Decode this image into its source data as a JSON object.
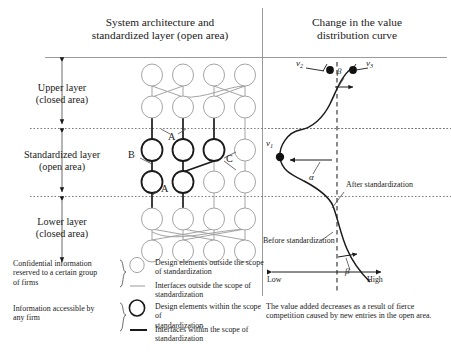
{
  "headers": {
    "left": [
      "System architecture and",
      "standardized layer (open area)"
    ],
    "right": [
      "Change in the value",
      "distribution curve"
    ]
  },
  "axis_labels": [
    {
      "line1": "Upper layer",
      "line2": "(closed area)"
    },
    {
      "line1": "Standardized layer",
      "line2": "(open area)"
    },
    {
      "line1": "Lower layer",
      "line2": "(closed area)"
    }
  ],
  "network_annotations": [
    {
      "name": "A-top",
      "text": "A"
    },
    {
      "name": "B",
      "text": "B"
    },
    {
      "name": "C",
      "text": "C"
    },
    {
      "name": "A-bottom",
      "text": "A"
    }
  ],
  "curve": {
    "point_labels": [
      {
        "name": "nu1",
        "base": "ν",
        "sub": "1"
      },
      {
        "name": "nu2",
        "base": "ν",
        "sub": "2"
      },
      {
        "name": "nu3",
        "base": "ν",
        "sub": "3"
      }
    ],
    "greek": [
      {
        "name": "alpha",
        "text": "α"
      },
      {
        "name": "beta-top",
        "text": "β"
      },
      {
        "name": "beta-bottom",
        "text": "β"
      }
    ],
    "annotations": [
      {
        "name": "after-standardization",
        "text": "After standardization"
      },
      {
        "name": "before-standardization",
        "text": "Before standardization"
      }
    ],
    "scale": {
      "low": "Low",
      "high": "High"
    },
    "caption": [
      "The value added decreases as a result of fierce",
      "competition caused by new entries in the open area."
    ]
  },
  "legend": {
    "groups": [
      {
        "name": "confidential",
        "lines": [
          "Confidential information",
          "reserved to a certain group",
          "of firms"
        ]
      },
      {
        "name": "accessible",
        "lines": [
          "Information accessible by",
          "any firm"
        ]
      }
    ],
    "entries": [
      {
        "name": "design-elements-outside",
        "icon": "thin-circle",
        "lines": [
          "Design elements outside the scope",
          "of standardization"
        ]
      },
      {
        "name": "interfaces-outside",
        "icon": "thin-line",
        "lines": [
          "Interfaces outside the scope of",
          "standardization"
        ]
      },
      {
        "name": "design-elements-within",
        "icon": "bold-circle",
        "lines": [
          "Design elements within the scope of",
          "standardization"
        ]
      },
      {
        "name": "interfaces-within",
        "icon": "bold-line",
        "lines": [
          "Interfaces within the scope of",
          "standardization"
        ]
      }
    ]
  },
  "colors": {
    "ink": "#1a1a1a",
    "faint": "#8d8d8d",
    "rule": "#9a9a9a",
    "dotted": "#6f6f6f"
  }
}
